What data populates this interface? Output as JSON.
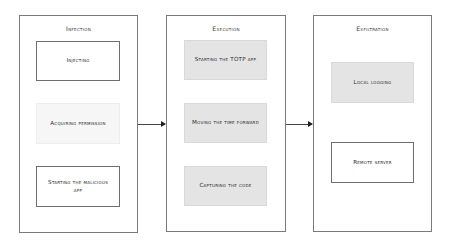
{
  "diagram": {
    "stages": [
      {
        "title": "Infection",
        "steps": [
          {
            "label": "Injecting",
            "style": "outlined"
          },
          {
            "label": "Acquiring permission",
            "style": "light"
          },
          {
            "label": "Starting the malicious app",
            "style": "outlined"
          }
        ]
      },
      {
        "title": "Execution",
        "steps": [
          {
            "label": "Starting the TOTP app",
            "style": "shaded"
          },
          {
            "label": "Moving the time forward",
            "style": "shaded"
          },
          {
            "label": "Capturing the code",
            "style": "shaded"
          }
        ]
      },
      {
        "title": "Exfiltration",
        "steps": [
          {
            "label": "Local logging",
            "style": "shaded"
          },
          {
            "label": "Remote server",
            "style": "outlined"
          }
        ]
      }
    ],
    "connections": [
      {
        "from": "Infection",
        "to": "Execution"
      },
      {
        "from": "Execution",
        "to": "Exfiltration"
      }
    ],
    "colors": {
      "border": "#7a7a7a",
      "shaded_fill": "#e4e4e4",
      "light_fill": "#f6f6f6",
      "arrow": "#444444"
    }
  }
}
